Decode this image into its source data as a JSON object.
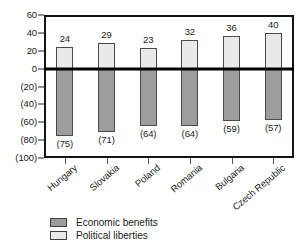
{
  "chart_data": {
    "type": "bar",
    "title": "",
    "subtitle": "",
    "xlabel": "",
    "ylabel": "",
    "categories": [
      "Hungary",
      "Slovakia",
      "Poland",
      "Romania",
      "Bulgaria",
      "Czech Republic"
    ],
    "series": [
      {
        "name": "Political liberties",
        "color": "#e9e9e9",
        "values": [
          24,
          29,
          23,
          32,
          36,
          40
        ],
        "labels": [
          "24",
          "29",
          "23",
          "32",
          "36",
          "40"
        ]
      },
      {
        "name": "Economic benefits",
        "color": "#9d9d9d",
        "values": [
          -75,
          -71,
          -64,
          -64,
          -59,
          -57
        ],
        "labels": [
          "(75)",
          "(71)",
          "(64)",
          "(64)",
          "(59)",
          "(57)"
        ]
      }
    ],
    "ylim": [
      -100,
      60
    ],
    "y_ticks": [
      60,
      40,
      20,
      0,
      -20,
      -40,
      -60,
      -80,
      -100
    ],
    "y_tick_labels": [
      "60",
      "40",
      "20",
      "0",
      "(20)",
      "(40)",
      "(60)",
      "(80)",
      "(100)"
    ],
    "grid": false,
    "legend_position": "bottom-left",
    "zero_line": true
  },
  "legend": {
    "entries": [
      {
        "label": "Economic benefits",
        "swatch": "economic"
      },
      {
        "label": "Political liberties",
        "swatch": "political"
      }
    ]
  }
}
